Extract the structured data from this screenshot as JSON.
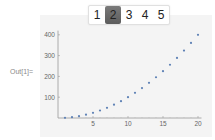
{
  "output_label": "Out[1]=",
  "setter_bar": {
    "options": [
      "1",
      "2",
      "3",
      "4",
      "5"
    ],
    "selected_index": 1,
    "selected_color": "#6b6b6b"
  },
  "chart_data": {
    "type": "scatter",
    "title": "",
    "xlabel": "",
    "ylabel": "",
    "x": [
      1,
      2,
      3,
      4,
      5,
      6,
      7,
      8,
      9,
      10,
      11,
      12,
      13,
      14,
      15,
      16,
      17,
      18,
      19,
      20
    ],
    "values": [
      1,
      4,
      9,
      16,
      25,
      36,
      49,
      64,
      81,
      100,
      121,
      144,
      169,
      196,
      225,
      256,
      289,
      324,
      361,
      400
    ],
    "x_ticks": [
      5,
      10,
      15,
      20
    ],
    "y_ticks": [
      100,
      200,
      300,
      400
    ],
    "xlim": [
      0,
      20.5
    ],
    "ylim": [
      0,
      420
    ],
    "grid": false,
    "point_color": "#5e81b5"
  }
}
